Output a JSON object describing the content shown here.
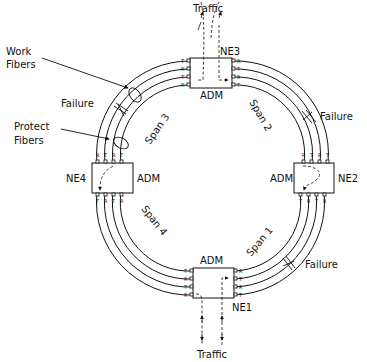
{
  "diagram": {
    "title": "",
    "colors": {
      "line": "#111111",
      "background": "#ffffff"
    },
    "nodes": [
      {
        "id": "NE1",
        "label": "NE1",
        "type_label": "ADM"
      },
      {
        "id": "NE2",
        "label": "NE2",
        "type_label": "ADM"
      },
      {
        "id": "NE3",
        "label": "NE3",
        "type_label": "ADM"
      },
      {
        "id": "NE4",
        "label": "NE4",
        "type_label": "ADM"
      }
    ],
    "spans": [
      {
        "label": "Span 1",
        "between": [
          "NE1",
          "NE2"
        ]
      },
      {
        "label": "Span 2",
        "between": [
          "NE2",
          "NE3"
        ]
      },
      {
        "label": "Span 3",
        "between": [
          "NE3",
          "NE4"
        ]
      },
      {
        "label": "Span 4",
        "between": [
          "NE4",
          "NE1"
        ]
      }
    ],
    "annotations": {
      "work_fibers": "Work\nFibers",
      "work_fibers_line1": "Work",
      "work_fibers_line2": "Fibers",
      "protect_fibers_line1": "Protect",
      "protect_fibers_line2": "Fibers",
      "failure": "Failure",
      "traffic": "Traffic"
    },
    "failures": [
      {
        "label": "Failure",
        "span": "Span 3"
      },
      {
        "label": "Failure",
        "span": "Span 2"
      },
      {
        "label": "Failure",
        "span": "Span 1"
      }
    ],
    "traffic": [
      {
        "label": "Traffic",
        "node": "NE3"
      },
      {
        "label": "Traffic",
        "node": "NE1"
      }
    ],
    "port_labels": {
      "receive": "R",
      "transmit": "T"
    }
  }
}
